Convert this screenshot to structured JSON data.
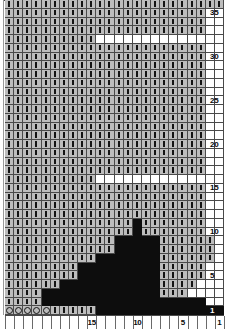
{
  "chart_data": {
    "type": "heatmap",
    "title": "",
    "xlabel": "",
    "ylabel": "",
    "grid": true,
    "legend_position": "none",
    "columns": 24,
    "rows": 36,
    "x_tick_labels": [
      "15",
      "10",
      "5",
      "1"
    ],
    "x_tick_values": [
      15,
      10,
      5,
      1
    ],
    "x_direction": "right-to-left",
    "y_tick_labels": [
      "1",
      "5",
      "10",
      "15",
      "20",
      "25",
      "30",
      "35"
    ],
    "y_tick_values": [
      1,
      5,
      10,
      15,
      20,
      25,
      30,
      35
    ],
    "y_direction": "bottom-to-top",
    "symbol_legend": [
      {
        "key": "purl",
        "glyph": "vertical-dash",
        "cell_fill": "#bdbdbd"
      },
      {
        "key": "yarnover",
        "glyph": "circle",
        "cell_fill": "#bdbdbd"
      },
      {
        "key": "dark",
        "glyph": "filled",
        "cell_fill": "#0d0d0d"
      },
      {
        "key": "blank",
        "glyph": "none",
        "cell_fill": "#ffffff"
      }
    ],
    "colors": {
      "purl_fill": "#bdbdbd",
      "dark_fill": "#0d0d0d",
      "blank_fill": "#ffffff",
      "gridline": "#4a4a4a",
      "label_text": "#0a0a0a"
    },
    "rows_data": [
      {
        "row": 36,
        "cells": "pppppppppppppppppppppppp"
      },
      {
        "row": 35,
        "cells": "pppppppppppppppppppppp.."
      },
      {
        "row": 34,
        "cells": "pppppppppppppppppppppp.."
      },
      {
        "row": 33,
        "cells": "pppppppppppppppppppppp.."
      },
      {
        "row": 32,
        "cells": "ppppppppppbbbbbbbbbbbb.."
      },
      {
        "row": 31,
        "cells": "pppppppppppppppppppppp.."
      },
      {
        "row": 30,
        "cells": "pppppppppppppppppppppp.."
      },
      {
        "row": 29,
        "cells": "pppppppppppppppppppppp.."
      },
      {
        "row": 28,
        "cells": "pppppppppppppppppppppp.."
      },
      {
        "row": 27,
        "cells": "pppppppppppppppppppppp.."
      },
      {
        "row": 26,
        "cells": "pppppppppppppppppppppp.."
      },
      {
        "row": 25,
        "cells": "pppppppppppppppppppppp.."
      },
      {
        "row": 24,
        "cells": "pppppppppppppppppppppp.."
      },
      {
        "row": 23,
        "cells": "pppppppppppppppppppppp.."
      },
      {
        "row": 22,
        "cells": "pppppppppppppppppppppp.."
      },
      {
        "row": 21,
        "cells": "pppppppppppppppppppppp.."
      },
      {
        "row": 20,
        "cells": "pppppppppppppppppppppp.."
      },
      {
        "row": 19,
        "cells": "pppppppppppppppppppppp.."
      },
      {
        "row": 18,
        "cells": "pppppppppppppppppppppp.."
      },
      {
        "row": 17,
        "cells": "pppppppppppppppppppppp.."
      },
      {
        "row": 16,
        "cells": "ppppppppppbbbbbbbbbbbb.."
      },
      {
        "row": 15,
        "cells": "pppppppppppppppppppppp.."
      },
      {
        "row": 14,
        "cells": "pppppppppppppppppppppp.."
      },
      {
        "row": 13,
        "cells": "pppppppppppppppppppppp.."
      },
      {
        "row": 12,
        "cells": "pppppppppppppppppppppp.."
      },
      {
        "row": 11,
        "cells": "ppppppppppppppdppppppp.."
      },
      {
        "row": 10,
        "cells": "ppppppppppppppdppppppp.."
      },
      {
        "row": 9,
        "cells": "ppppppppppppdddddpppppp."
      },
      {
        "row": 8,
        "cells": "ppppppppppppdddddpppppp."
      },
      {
        "row": 7,
        "cells": "ppppppppppdddddddpppppp."
      },
      {
        "row": 6,
        "cells": "ppppppppdddddddddppppp.."
      },
      {
        "row": 5,
        "cells": "ppppppppdddddddddppppp.."
      },
      {
        "row": 4,
        "cells": "ppppppdddddddddddpppp..."
      },
      {
        "row": 3,
        "cells": "ppppdddddddddddddppp...."
      },
      {
        "row": 2,
        "cells": "ppppdddddddddddddddddd.."
      },
      {
        "row": 1,
        "cells": "ooooopppppdddddddddddddd"
      }
    ],
    "blank_notches": [
      {
        "row": 32,
        "start_col": 11,
        "end_col": 22
      },
      {
        "row": 16,
        "start_col": 11,
        "end_col": 22
      }
    ]
  }
}
